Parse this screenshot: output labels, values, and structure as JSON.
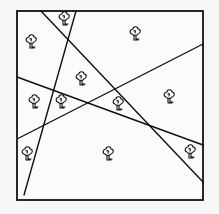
{
  "diagram": {
    "colors": {
      "ink": "#111111",
      "paper": "#fbfbfa",
      "background": "#f7f7f5"
    },
    "square": {
      "x1": 17,
      "y1": 11,
      "x2": 203,
      "y2": 200
    },
    "lines": [
      {
        "id": "line-1",
        "x1": 76,
        "y1": 11,
        "x2": 24,
        "y2": 195
      },
      {
        "id": "line-2",
        "x1": 41,
        "y1": 11,
        "x2": 203,
        "y2": 182
      },
      {
        "id": "line-3",
        "x1": 17,
        "y1": 139,
        "x2": 203,
        "y2": 44
      },
      {
        "id": "line-4",
        "x1": 17,
        "y1": 77,
        "x2": 203,
        "y2": 145
      }
    ],
    "trees": [
      {
        "icon": "tree-icon",
        "x": 64,
        "y": 18
      },
      {
        "icon": "tree-icon",
        "x": 31,
        "y": 41
      },
      {
        "icon": "tree-icon",
        "x": 135,
        "y": 33
      },
      {
        "icon": "tree-icon",
        "x": 81,
        "y": 78
      },
      {
        "icon": "tree-icon",
        "x": 34,
        "y": 101
      },
      {
        "icon": "tree-icon",
        "x": 61,
        "y": 101
      },
      {
        "icon": "tree-icon",
        "x": 118,
        "y": 103
      },
      {
        "icon": "tree-icon",
        "x": 169,
        "y": 96
      },
      {
        "icon": "tree-icon",
        "x": 27,
        "y": 153
      },
      {
        "icon": "tree-icon",
        "x": 108,
        "y": 153
      },
      {
        "icon": "tree-icon",
        "x": 190,
        "y": 151
      }
    ],
    "tree_count": 11,
    "line_count": 4
  }
}
